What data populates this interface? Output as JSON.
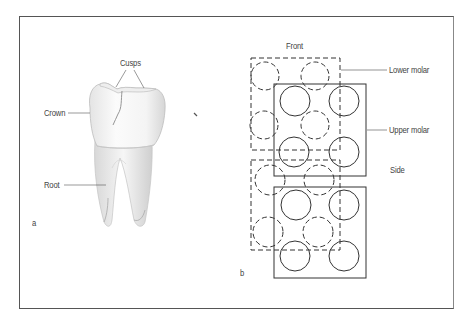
{
  "panel_a": {
    "label": "a",
    "subject": "molar tooth illustration",
    "callouts": {
      "cusps": "Cusps",
      "crown": "Crown",
      "root": "Root"
    }
  },
  "panel_b": {
    "label": "b",
    "view_top": "Front",
    "view_side": "Side",
    "legend": {
      "lower": "Lower molar",
      "upper": "Upper molar"
    },
    "colors": {
      "line": "#333333",
      "leader": "#666666"
    }
  }
}
